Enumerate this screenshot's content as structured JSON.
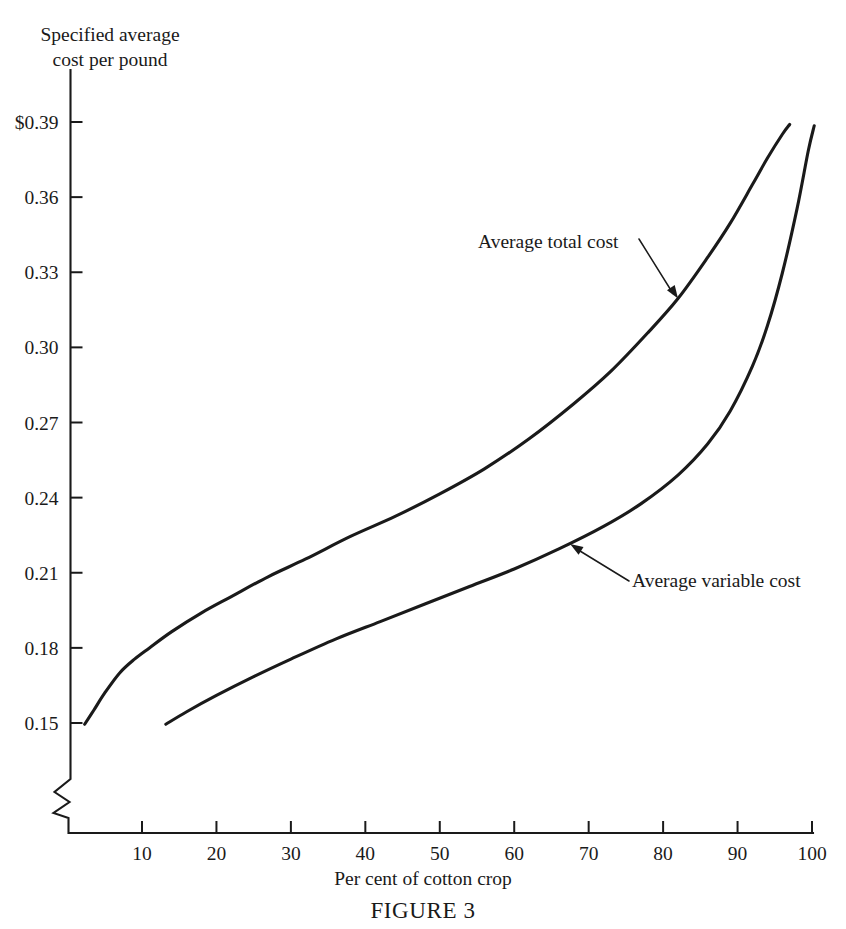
{
  "figure": {
    "caption": "FIGURE 3",
    "y_axis_caption": "Specified average\ncost per pound",
    "x_axis_caption": "Per cent of cotton crop",
    "corner_mark": ""
  },
  "chart_data": {
    "type": "line",
    "title": "FIGURE 3",
    "xlabel": "Per cent of cotton crop",
    "ylabel": "Specified average cost per pound",
    "grid": false,
    "legend_position": "inline-annotation",
    "xlim": [
      0,
      100
    ],
    "ylim": [
      0.15,
      0.39
    ],
    "y_axis_broken_below": 0.15,
    "xticks": [
      10,
      20,
      30,
      40,
      50,
      60,
      70,
      80,
      90,
      100
    ],
    "xticklabels": [
      "10",
      "20",
      "30",
      "40",
      "50",
      "60",
      "70",
      "80",
      "90",
      "100"
    ],
    "yticks": [
      0.15,
      0.18,
      0.21,
      0.24,
      0.27,
      0.3,
      0.33,
      0.36,
      0.39
    ],
    "yticklabels": [
      "0.15",
      "0.18",
      "0.21",
      "0.24",
      "0.27",
      "0.30",
      "0.33",
      "0.36",
      "$0.39"
    ],
    "series": [
      {
        "name": "Average total cost",
        "label_text": "Average total cost",
        "x": [
          2.3,
          3.5,
          5,
          7,
          9,
          11,
          14,
          18,
          22,
          27,
          32,
          38,
          44,
          50,
          56,
          62,
          68,
          73,
          78,
          82,
          86,
          89,
          92,
          94,
          96,
          97
        ],
        "y": [
          0.1495,
          0.155,
          0.162,
          0.17,
          0.1755,
          0.18,
          0.1865,
          0.194,
          0.2005,
          0.2085,
          0.2155,
          0.2245,
          0.2325,
          0.2415,
          0.2515,
          0.2635,
          0.2775,
          0.2905,
          0.306,
          0.3195,
          0.336,
          0.3495,
          0.365,
          0.3755,
          0.385,
          0.389
        ]
      },
      {
        "name": "Average variable cost",
        "label_text": "Average variable cost",
        "x": [
          13.2,
          16,
          20,
          25,
          30,
          36,
          42,
          48,
          54,
          60,
          66,
          72,
          77,
          82,
          86,
          89,
          92,
          94,
          96,
          98,
          99.5,
          100.3
        ],
        "y": [
          0.1495,
          0.1545,
          0.161,
          0.1685,
          0.1755,
          0.1835,
          0.1905,
          0.1975,
          0.2045,
          0.2115,
          0.2195,
          0.2285,
          0.2375,
          0.249,
          0.2615,
          0.2745,
          0.2925,
          0.3085,
          0.3295,
          0.3555,
          0.3785,
          0.3885
        ]
      }
    ],
    "annotations": [
      {
        "text": "Average total cost",
        "target_x": 82,
        "target_y": 0.3195
      },
      {
        "text": "Average variable cost",
        "target_x": 67.5,
        "target_y": 0.2215
      }
    ]
  }
}
